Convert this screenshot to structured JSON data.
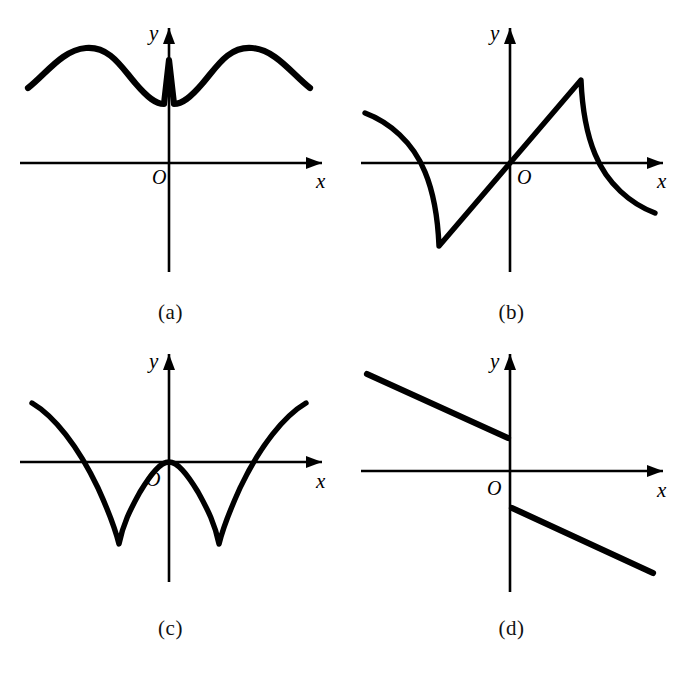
{
  "figure": {
    "panel_count": 4,
    "background_color": "#ffffff",
    "ink_color": "#000000",
    "axis_labels": {
      "x": "x",
      "y": "y",
      "origin": "O"
    }
  },
  "panels": [
    {
      "id": "a",
      "caption": "(a)",
      "description": "Smooth wavy curve lying entirely above the x-axis with an upward cusp on the y-axis",
      "symmetry": "even",
      "curve_path": "M 22 88 C 40 74, 56 50, 80 48 C 104 46, 116 68, 130 84 C 142 98, 150 104, 158 104 L 163 60 L 168 104 C 176 104, 184 98, 196 84 C 210 68, 222 46, 246 48 C 270 50, 286 74, 304 88",
      "x_axis": {
        "y": 163,
        "x_start": 14,
        "x_end": 316
      },
      "y_axis": {
        "x": 163,
        "y_start": 28,
        "y_end": 272
      },
      "origin_label_pos": {
        "x": 146,
        "y": 184
      },
      "x_label_pos": {
        "x": 310,
        "y": 188
      },
      "y_label_pos": {
        "x": 143,
        "y": 40
      }
    },
    {
      "id": "b",
      "caption": "(b)",
      "description": "Odd-symmetric sawtooth: straight rise through origin to a sharp peak, then concave drop crossing the axis",
      "symmetry": "odd",
      "curve_path": "M 18 113 C 42 122, 66 142, 78 172 C 88 196, 91 222, 92 246 L 163 163 L 234 80 C 235 104, 238 130, 248 154 C 260 184, 284 204, 308 213",
      "x_axis": {
        "y": 163,
        "x_start": 14,
        "x_end": 316
      },
      "y_axis": {
        "x": 163,
        "y_start": 28,
        "y_end": 272
      },
      "origin_label_pos": {
        "x": 170,
        "y": 184
      },
      "x_label_pos": {
        "x": 310,
        "y": 188
      },
      "y_label_pos": {
        "x": 143,
        "y": 40
      }
    },
    {
      "id": "c",
      "caption": "(c)",
      "description": "Two downward cusps below the axis, curve touches zero at the origin and rises steeply at the outer edges",
      "symmetry": "even",
      "curve_path": "M 26 65 C 48 78, 72 108, 92 150 C 102 172, 108 186, 113 206 C 117 186, 124 172, 134 154 C 146 134, 155 124, 163 124 C 171 124, 180 134, 192 154 C 202 172, 209 186, 213 206 C 218 186, 224 172, 234 150 C 254 108, 278 78, 300 65",
      "x_axis": {
        "y": 124,
        "x_start": 14,
        "x_end": 316
      },
      "y_axis": {
        "x": 163,
        "y_start": 16,
        "y_end": 244
      },
      "origin_label_pos": {
        "x": 140,
        "y": 148
      },
      "x_label_pos": {
        "x": 310,
        "y": 150
      },
      "y_label_pos": {
        "x": 143,
        "y": 30
      }
    },
    {
      "id": "d",
      "caption": "(d)",
      "description": "Two parallel descending line segments with a jump discontinuity at x = 0",
      "symmetry": "none",
      "segment_left": {
        "x1": 20,
        "y1": 36,
        "x2": 161,
        "y2": 100
      },
      "segment_right": {
        "x1": 165,
        "y1": 170,
        "x2": 306,
        "y2": 235
      },
      "x_axis": {
        "y": 133,
        "x_start": 14,
        "x_end": 316
      },
      "y_axis": {
        "x": 163,
        "y_start": 16,
        "y_end": 254
      },
      "origin_label_pos": {
        "x": 140,
        "y": 157
      },
      "x_label_pos": {
        "x": 310,
        "y": 159
      },
      "y_label_pos": {
        "x": 143,
        "y": 30
      }
    }
  ]
}
